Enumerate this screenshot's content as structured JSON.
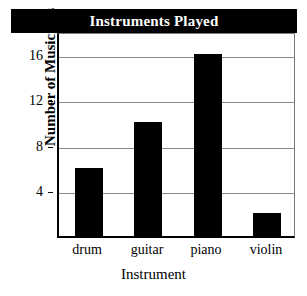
{
  "chart_data": {
    "type": "bar",
    "title": "Instruments Played",
    "xlabel": "Instrument",
    "ylabel": "Number of Musicians",
    "categories": [
      "drum",
      "guitar",
      "piano",
      "violin"
    ],
    "values": [
      6,
      10,
      16,
      2
    ],
    "ylim": [
      0,
      18
    ],
    "yticks": [
      4,
      8,
      12,
      16
    ],
    "ytick_labels": [
      "4",
      "8",
      "12",
      "16"
    ],
    "grid": true,
    "legend": false,
    "bar_color": "#000000",
    "title_background": "#000000",
    "title_color": "#ffffff",
    "gridline_color": "#8a8a8a",
    "axis_color": "#000000"
  }
}
